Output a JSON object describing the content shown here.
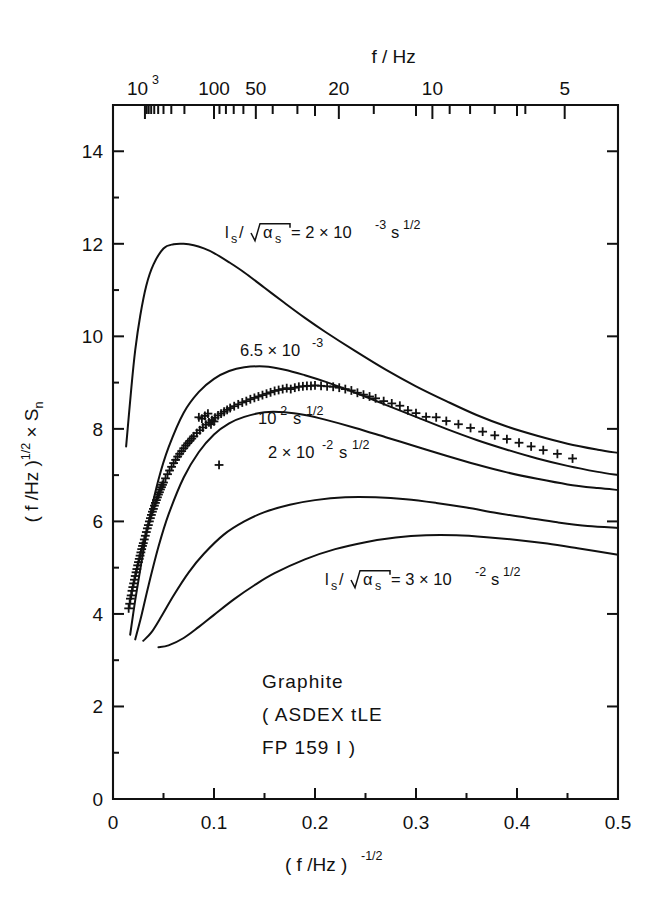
{
  "figure": {
    "title": "",
    "background": "#ffffff",
    "ink_color": "#111111"
  },
  "axes": {
    "bottom": {
      "label": "( f /Hz )",
      "label_exponent": "-1/2",
      "ticks": [
        "0",
        "0.1",
        "0.2",
        "0.3",
        "0.4",
        "0.5"
      ],
      "range": [
        0,
        0.5
      ]
    },
    "left": {
      "label_pre": "( f /Hz )",
      "label_exp": "1/2",
      "label_post": " × S",
      "label_sub": "n",
      "ticks": [
        "0",
        "2",
        "4",
        "6",
        "8",
        "10",
        "12",
        "14"
      ],
      "range": [
        0,
        15
      ]
    },
    "top": {
      "label": "f / Hz",
      "ticks": [
        {
          "text": "10",
          "exp": "3",
          "f": 1000
        },
        {
          "text": "100",
          "exp": "",
          "f": 100
        },
        {
          "text": "50",
          "exp": "",
          "f": 50
        },
        {
          "text": "20",
          "exp": "",
          "f": 20
        },
        {
          "text": "10",
          "exp": "",
          "f": 10
        },
        {
          "text": "5",
          "exp": "",
          "f": 5
        }
      ],
      "minor_f": [
        900,
        800,
        700,
        600,
        500,
        400,
        300,
        200,
        90,
        80,
        70,
        60,
        40,
        30,
        15,
        9,
        8,
        7,
        6,
        4,
        3
      ]
    }
  },
  "curve_labels": [
    {
      "id": "c1",
      "text_pre": "l",
      "sub1": "s",
      "slash": " /",
      "radicand_pre": "α",
      "radicand_sub": "s",
      "eq": " =  2 × 10",
      "exp": "-3",
      "unit": " s",
      "unit_exp": "1/2",
      "x": 225,
      "y": 238,
      "full": "l_s /√α_s = 2 × 10^-3 s^1/2"
    },
    {
      "id": "c2",
      "text": "6.5 × 10",
      "exp": "-3",
      "x": 240,
      "y": 356,
      "full": "6.5 × 10^-3"
    },
    {
      "id": "c3",
      "text": "10",
      "exp": "-2",
      "unit": " s",
      "unit_exp": "1/2",
      "x": 258,
      "y": 424,
      "full": "10^-2 s^1/2"
    },
    {
      "id": "c4",
      "text": "2 × 10",
      "exp": "-2",
      "unit": " s",
      "unit_exp": "1/2",
      "x": 268,
      "y": 458,
      "full": "2 × 10^-2 s^1/2"
    },
    {
      "id": "c5",
      "text_pre": "l",
      "sub1": "s",
      "slash": " /",
      "radicand_pre": "α",
      "radicand_sub": "s",
      "eq": " =  3 × 10",
      "exp": "-2",
      "unit": " s",
      "unit_exp": "1/2",
      "x": 325,
      "y": 585,
      "full": "l_s /√α_s = 3 × 10^-2 s^1/2"
    }
  ],
  "annotation": {
    "lines": [
      "Graphite",
      "( ASDEX  tLE",
      "FP 159 I )"
    ],
    "x": 262,
    "y": 688
  },
  "chart_data": {
    "type": "line",
    "title": "",
    "xlabel": "( f /Hz )^-1/2",
    "ylabel": "( f /Hz )^1/2 × S_n",
    "xlim": [
      0,
      0.5
    ],
    "ylim": [
      0,
      15
    ],
    "grid": false,
    "legend": "inline curve labels",
    "secondary_xaxis": {
      "label": "f / Hz",
      "relation": "f = x^-2",
      "ticks": [
        1000,
        100,
        50,
        20,
        10,
        5
      ]
    },
    "series": [
      {
        "name": "l_s/sqrt(alpha_s) = 2 × 10^-3 s^1/2",
        "style": "solid",
        "x": [
          0.013,
          0.018,
          0.022,
          0.027,
          0.033,
          0.04,
          0.05,
          0.06,
          0.07,
          0.08,
          0.09,
          0.1,
          0.115,
          0.13,
          0.15,
          0.17,
          0.19,
          0.21,
          0.24,
          0.27,
          0.3,
          0.33,
          0.36,
          0.39,
          0.42,
          0.45,
          0.48,
          0.5
        ],
        "y": [
          7.62,
          8.85,
          9.7,
          10.45,
          11.1,
          11.55,
          11.9,
          11.99,
          12.0,
          11.97,
          11.9,
          11.8,
          11.6,
          11.38,
          11.05,
          10.72,
          10.4,
          10.1,
          9.68,
          9.28,
          8.92,
          8.6,
          8.3,
          8.05,
          7.85,
          7.68,
          7.55,
          7.48
        ]
      },
      {
        "name": "6.5 × 10^-3",
        "style": "solid",
        "x": [
          0.017,
          0.022,
          0.028,
          0.035,
          0.045,
          0.055,
          0.07,
          0.085,
          0.1,
          0.115,
          0.13,
          0.15,
          0.17,
          0.19,
          0.21,
          0.24,
          0.27,
          0.3,
          0.33,
          0.36,
          0.39,
          0.42,
          0.45,
          0.48,
          0.5
        ],
        "y": [
          3.55,
          4.3,
          5.1,
          5.95,
          6.9,
          7.6,
          8.35,
          8.8,
          9.08,
          9.25,
          9.33,
          9.35,
          9.28,
          9.16,
          9.02,
          8.78,
          8.52,
          8.26,
          8.0,
          7.76,
          7.55,
          7.36,
          7.2,
          7.07,
          7.0
        ]
      },
      {
        "name": "10^-2 s^1/2",
        "style": "solid",
        "x": [
          0.022,
          0.028,
          0.035,
          0.045,
          0.055,
          0.07,
          0.085,
          0.1,
          0.115,
          0.13,
          0.15,
          0.17,
          0.19,
          0.21,
          0.24,
          0.27,
          0.3,
          0.33,
          0.36,
          0.39,
          0.42,
          0.45,
          0.48,
          0.5
        ],
        "y": [
          3.45,
          3.95,
          4.6,
          5.45,
          6.15,
          6.95,
          7.5,
          7.88,
          8.12,
          8.26,
          8.36,
          8.36,
          8.3,
          8.2,
          8.02,
          7.82,
          7.62,
          7.42,
          7.23,
          7.06,
          6.92,
          6.8,
          6.72,
          6.68
        ]
      },
      {
        "name": "2 × 10^-2 s^1/2",
        "style": "solid",
        "x": [
          0.03,
          0.038,
          0.048,
          0.06,
          0.075,
          0.09,
          0.11,
          0.13,
          0.15,
          0.175,
          0.2,
          0.23,
          0.26,
          0.29,
          0.32,
          0.35,
          0.38,
          0.41,
          0.44,
          0.47,
          0.5
        ],
        "y": [
          3.42,
          3.6,
          3.95,
          4.4,
          4.9,
          5.3,
          5.72,
          6.0,
          6.2,
          6.36,
          6.46,
          6.52,
          6.52,
          6.48,
          6.4,
          6.3,
          6.18,
          6.08,
          5.98,
          5.9,
          5.86
        ]
      },
      {
        "name": "l_s/sqrt(alpha_s) = 3 × 10^-2 s^1/2",
        "style": "solid",
        "x": [
          0.045,
          0.055,
          0.07,
          0.085,
          0.1,
          0.12,
          0.14,
          0.16,
          0.19,
          0.22,
          0.25,
          0.28,
          0.31,
          0.34,
          0.37,
          0.4,
          0.43,
          0.46,
          0.5
        ],
        "y": [
          3.28,
          3.32,
          3.48,
          3.72,
          3.98,
          4.32,
          4.62,
          4.88,
          5.18,
          5.4,
          5.55,
          5.65,
          5.7,
          5.7,
          5.66,
          5.6,
          5.52,
          5.42,
          5.28
        ]
      }
    ],
    "scatter": {
      "name": "measured data",
      "marker": "plus",
      "points": [
        [
          0.0155,
          4.12
        ],
        [
          0.0165,
          4.22
        ],
        [
          0.0172,
          4.33
        ],
        [
          0.018,
          4.4
        ],
        [
          0.0188,
          4.5
        ],
        [
          0.0196,
          4.58
        ],
        [
          0.0204,
          4.66
        ],
        [
          0.0212,
          4.74
        ],
        [
          0.022,
          4.82
        ],
        [
          0.0228,
          4.9
        ],
        [
          0.0236,
          4.97
        ],
        [
          0.0244,
          5.05
        ],
        [
          0.0252,
          5.12
        ],
        [
          0.026,
          5.19
        ],
        [
          0.0268,
          5.26
        ],
        [
          0.0276,
          5.33
        ],
        [
          0.0284,
          5.4
        ],
        [
          0.0292,
          5.47
        ],
        [
          0.03,
          5.53
        ],
        [
          0.031,
          5.61
        ],
        [
          0.032,
          5.69
        ],
        [
          0.033,
          5.77
        ],
        [
          0.034,
          5.85
        ],
        [
          0.035,
          5.92
        ],
        [
          0.036,
          6.0
        ],
        [
          0.037,
          6.07
        ],
        [
          0.038,
          6.14
        ],
        [
          0.039,
          6.21
        ],
        [
          0.04,
          6.27
        ],
        [
          0.041,
          6.34
        ],
        [
          0.042,
          6.4
        ],
        [
          0.043,
          6.46
        ],
        [
          0.044,
          6.52
        ],
        [
          0.045,
          6.58
        ],
        [
          0.046,
          6.63
        ],
        [
          0.047,
          6.69
        ],
        [
          0.048,
          6.74
        ],
        [
          0.049,
          6.79
        ],
        [
          0.05,
          6.84
        ],
        [
          0.052,
          6.93
        ],
        [
          0.054,
          7.02
        ],
        [
          0.056,
          7.1
        ],
        [
          0.058,
          7.18
        ],
        [
          0.06,
          7.26
        ],
        [
          0.062,
          7.33
        ],
        [
          0.064,
          7.4
        ],
        [
          0.066,
          7.46
        ],
        [
          0.068,
          7.52
        ],
        [
          0.07,
          7.58
        ],
        [
          0.072,
          7.64
        ],
        [
          0.074,
          7.69
        ],
        [
          0.076,
          7.74
        ],
        [
          0.078,
          7.79
        ],
        [
          0.08,
          7.84
        ],
        [
          0.083,
          7.91
        ],
        [
          0.086,
          7.97
        ],
        [
          0.089,
          8.03
        ],
        [
          0.092,
          8.09
        ],
        [
          0.095,
          8.14
        ],
        [
          0.098,
          8.19
        ],
        [
          0.101,
          8.24
        ],
        [
          0.104,
          8.29
        ],
        [
          0.107,
          8.33
        ],
        [
          0.11,
          8.37
        ],
        [
          0.113,
          8.41
        ],
        [
          0.116,
          8.45
        ],
        [
          0.105,
          7.22
        ],
        [
          0.085,
          8.25
        ],
        [
          0.088,
          8.22
        ],
        [
          0.091,
          8.28
        ],
        [
          0.094,
          8.33
        ],
        [
          0.097,
          8.1
        ],
        [
          0.1,
          8.16
        ],
        [
          0.12,
          8.49
        ],
        [
          0.124,
          8.53
        ],
        [
          0.128,
          8.57
        ],
        [
          0.132,
          8.6
        ],
        [
          0.136,
          8.64
        ],
        [
          0.14,
          8.67
        ],
        [
          0.144,
          8.7
        ],
        [
          0.148,
          8.73
        ],
        [
          0.152,
          8.76
        ],
        [
          0.156,
          8.79
        ],
        [
          0.16,
          8.82
        ],
        [
          0.164,
          8.84
        ],
        [
          0.168,
          8.86
        ],
        [
          0.172,
          8.88
        ],
        [
          0.176,
          8.86
        ],
        [
          0.18,
          8.89
        ],
        [
          0.184,
          8.91
        ],
        [
          0.188,
          8.92
        ],
        [
          0.192,
          8.93
        ],
        [
          0.196,
          8.93
        ],
        [
          0.2,
          8.94
        ],
        [
          0.206,
          8.93
        ],
        [
          0.212,
          8.92
        ],
        [
          0.218,
          8.91
        ],
        [
          0.224,
          8.89
        ],
        [
          0.23,
          8.86
        ],
        [
          0.236,
          8.83
        ],
        [
          0.242,
          8.78
        ],
        [
          0.248,
          8.74
        ],
        [
          0.254,
          8.7
        ],
        [
          0.26,
          8.66
        ],
        [
          0.268,
          8.6
        ],
        [
          0.276,
          8.55
        ],
        [
          0.284,
          8.5
        ],
        [
          0.292,
          8.4
        ],
        [
          0.3,
          8.34
        ],
        [
          0.31,
          8.26
        ],
        [
          0.32,
          8.25
        ],
        [
          0.33,
          8.17
        ],
        [
          0.342,
          8.1
        ],
        [
          0.354,
          8.02
        ],
        [
          0.366,
          7.94
        ],
        [
          0.378,
          7.86
        ],
        [
          0.39,
          7.78
        ],
        [
          0.402,
          7.7
        ],
        [
          0.414,
          7.62
        ],
        [
          0.426,
          7.54
        ],
        [
          0.44,
          7.46
        ],
        [
          0.455,
          7.36
        ]
      ]
    }
  }
}
